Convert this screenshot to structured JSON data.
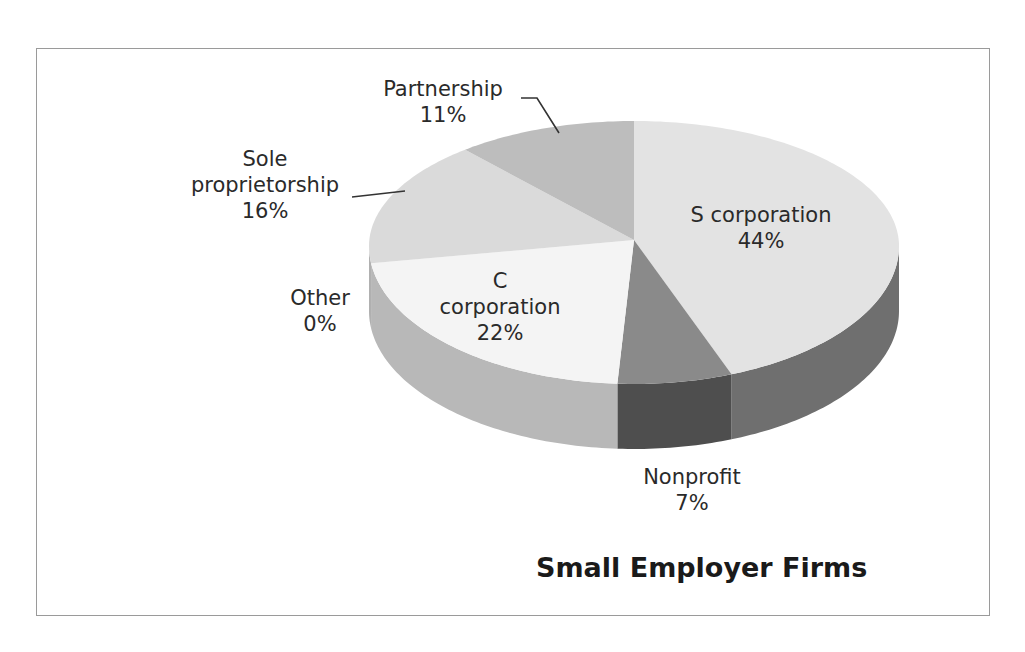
{
  "chart_data": {
    "type": "pie",
    "title": "Small Employer Firms",
    "style": "3d",
    "categories": [
      "S corporation",
      "Nonprofit",
      "C corporation",
      "Other",
      "Sole proprietorship",
      "Partnership"
    ],
    "values": [
      44,
      7,
      22,
      0,
      16,
      11
    ],
    "unit": "%",
    "colors": {
      "S corporation": "#e3e3e3",
      "Nonprofit": "#8a8a8a",
      "C corporation": "#f4f4f4",
      "Other": "#cfcfcf",
      "Sole proprietorship": "#dadada",
      "Partnership": "#bdbdbd"
    },
    "side_colors": {
      "S corporation": "#6f6f6f",
      "Nonprofit": "#4e4e4e",
      "C corporation": "#b8b8b8",
      "Other": "#a8a8a8",
      "Sole proprietorship": "#b0b0b0",
      "Partnership": "#999999"
    },
    "labels": [
      {
        "name": "S corporation",
        "line1": "S corporation",
        "line2": "44%"
      },
      {
        "name": "Nonprofit",
        "line1": "Nonprofit",
        "line2": "7%"
      },
      {
        "name": "C corporation",
        "line0": "C",
        "line1": "corporation",
        "line2": "22%"
      },
      {
        "name": "Other",
        "line1": "Other",
        "line2": "0%"
      },
      {
        "name": "Sole proprietorship",
        "line0": "Sole",
        "line1": "proprietorship",
        "line2": "16%"
      },
      {
        "name": "Partnership",
        "line1": "Partnership",
        "line2": "11%"
      }
    ],
    "legend": "none"
  }
}
